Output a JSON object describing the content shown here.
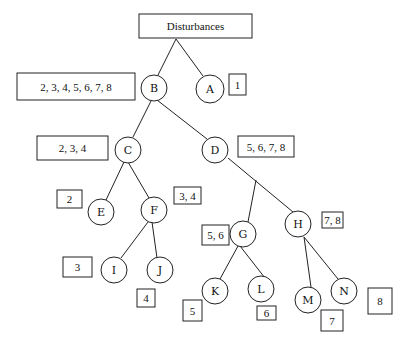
{
  "diagram": {
    "type": "tree",
    "root": {
      "id": "root",
      "label": "Disturbances",
      "x": 139,
      "y": 14,
      "w": 113,
      "h": 24
    },
    "nodes": [
      {
        "id": "B",
        "label": "B",
        "cx": 154,
        "cy": 88,
        "r": 13
      },
      {
        "id": "A",
        "label": "A",
        "cx": 210,
        "cy": 89,
        "r": 14
      },
      {
        "id": "C",
        "label": "C",
        "cx": 128,
        "cy": 150,
        "r": 13
      },
      {
        "id": "D",
        "label": "D",
        "cx": 215,
        "cy": 150,
        "r": 13
      },
      {
        "id": "E",
        "label": "E",
        "cx": 101,
        "cy": 212,
        "r": 13
      },
      {
        "id": "F",
        "label": "F",
        "cx": 154,
        "cy": 210,
        "r": 13
      },
      {
        "id": "G",
        "label": "G",
        "cx": 243,
        "cy": 234,
        "r": 13
      },
      {
        "id": "H",
        "label": "H",
        "cx": 298,
        "cy": 224,
        "r": 13
      },
      {
        "id": "I",
        "label": "I",
        "cx": 114,
        "cy": 270,
        "r": 13
      },
      {
        "id": "J",
        "label": "J",
        "cx": 160,
        "cy": 270,
        "r": 13
      },
      {
        "id": "K",
        "label": "K",
        "cx": 215,
        "cy": 291,
        "r": 13
      },
      {
        "id": "L",
        "label": "L",
        "cx": 261,
        "cy": 289,
        "r": 13
      },
      {
        "id": "M",
        "label": "M",
        "cx": 308,
        "cy": 300,
        "r": 13
      },
      {
        "id": "N",
        "label": "N",
        "cx": 344,
        "cy": 291,
        "r": 13
      }
    ],
    "edges": [
      {
        "x1": 176,
        "y1": 39,
        "x2": 158,
        "y2": 75
      },
      {
        "x1": 176,
        "y1": 39,
        "x2": 203,
        "y2": 76
      },
      {
        "x1": 151,
        "y1": 101,
        "x2": 133,
        "y2": 137
      },
      {
        "x1": 157,
        "y1": 100,
        "x2": 207,
        "y2": 139
      },
      {
        "x1": 124,
        "y1": 162,
        "x2": 106,
        "y2": 200
      },
      {
        "x1": 128,
        "y1": 162,
        "x2": 149,
        "y2": 198
      },
      {
        "x1": 228,
        "y1": 158,
        "x2": 293,
        "y2": 212
      },
      {
        "x1": 256,
        "y1": 180,
        "x2": 248,
        "y2": 222
      },
      {
        "x1": 148,
        "y1": 222,
        "x2": 121,
        "y2": 258
      },
      {
        "x1": 152,
        "y1": 222,
        "x2": 157,
        "y2": 258
      },
      {
        "x1": 238,
        "y1": 246,
        "x2": 220,
        "y2": 279
      },
      {
        "x1": 240,
        "y1": 246,
        "x2": 265,
        "y2": 278
      },
      {
        "x1": 304,
        "y1": 237,
        "x2": 311,
        "y2": 287
      },
      {
        "x1": 304,
        "y1": 237,
        "x2": 338,
        "y2": 279
      }
    ],
    "boxes": [
      {
        "id": "box-B",
        "label": "2, 3, 4, 5, 6, 7, 8",
        "x": 17,
        "y": 73,
        "w": 118,
        "h": 27
      },
      {
        "id": "box-A",
        "label": "1",
        "x": 229,
        "y": 74,
        "w": 17,
        "h": 21
      },
      {
        "id": "box-C",
        "label": "2, 3, 4",
        "x": 37,
        "y": 136,
        "w": 71,
        "h": 24
      },
      {
        "id": "box-D",
        "label": "5, 6, 7, 8",
        "x": 238,
        "y": 136,
        "w": 56,
        "h": 21
      },
      {
        "id": "box-E",
        "label": "2",
        "x": 57,
        "y": 190,
        "w": 25,
        "h": 18
      },
      {
        "id": "box-F",
        "label": "3, 4",
        "x": 174,
        "y": 187,
        "w": 27,
        "h": 17
      },
      {
        "id": "box-G",
        "label": "5, 6",
        "x": 202,
        "y": 225,
        "w": 27,
        "h": 20
      },
      {
        "id": "box-H",
        "label": "7, 8",
        "x": 322,
        "y": 212,
        "w": 21,
        "h": 16
      },
      {
        "id": "box-I",
        "label": "3",
        "x": 63,
        "y": 257,
        "w": 29,
        "h": 20
      },
      {
        "id": "box-J",
        "label": "4",
        "x": 137,
        "y": 289,
        "w": 18,
        "h": 18
      },
      {
        "id": "box-K",
        "label": "5",
        "x": 183,
        "y": 300,
        "w": 19,
        "h": 21
      },
      {
        "id": "box-L",
        "label": "6",
        "x": 257,
        "y": 306,
        "w": 19,
        "h": 14
      },
      {
        "id": "box-M",
        "label": "7",
        "x": 321,
        "y": 310,
        "w": 22,
        "h": 21
      },
      {
        "id": "box-N",
        "label": "8",
        "x": 368,
        "y": 288,
        "w": 24,
        "h": 26
      }
    ]
  }
}
